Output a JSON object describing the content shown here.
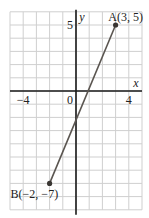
{
  "chart_data": {
    "type": "line",
    "title": "",
    "xlabel": "x",
    "ylabel": "y",
    "xlim": [
      -5,
      5
    ],
    "ylim": [
      -9,
      6
    ],
    "grid": true,
    "x_tick_labels": [
      {
        "value": -4,
        "label": "−4"
      },
      {
        "value": 0,
        "label": "0"
      },
      {
        "value": 4,
        "label": "4"
      }
    ],
    "y_tick_labels": [
      {
        "value": 5,
        "label": "5"
      }
    ],
    "series": [
      {
        "name": "segment AB",
        "points": [
          {
            "x": -2,
            "y": -7,
            "label": "B(−2, −7)"
          },
          {
            "x": 3,
            "y": 5,
            "label": "A(3, 5)"
          }
        ]
      }
    ],
    "colors": {
      "grid": "#cfcfcf",
      "axis": "#1a1a1a",
      "line": "#5a5550",
      "point": "#3a3633"
    }
  }
}
